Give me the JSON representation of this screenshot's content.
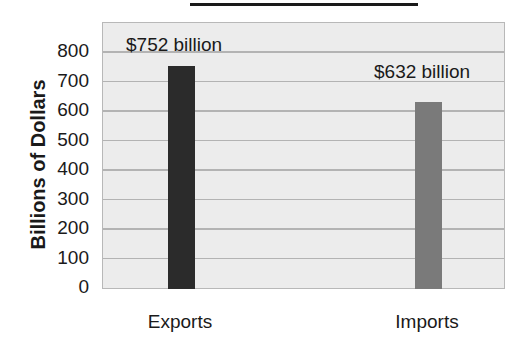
{
  "chart_data": {
    "type": "bar",
    "title": "",
    "xlabel": "",
    "ylabel": "Billions of Dollars",
    "categories": [
      "Exports",
      "Imports"
    ],
    "values": [
      752,
      632
    ],
    "data_labels": [
      "$752 billion",
      "$632 billion"
    ],
    "colors": [
      "#2b2b2b",
      "#7a7a7a"
    ],
    "ylim": [
      0,
      800
    ],
    "yticks": [
      "0",
      "100",
      "200",
      "300",
      "400",
      "500",
      "600",
      "700",
      "800"
    ],
    "grid": true,
    "legend": "none"
  }
}
